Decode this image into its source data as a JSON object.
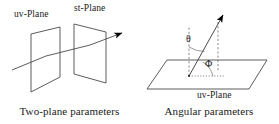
{
  "figure": {
    "background_color": "#ffffff",
    "stroke_color": "#4a4a4a",
    "arrow_color": "#000000",
    "text_color": "#1a1a1a"
  },
  "panels": {
    "two_plane": {
      "caption": "Two-plane parameters",
      "labels": {
        "uv_plane": "uv-Plane",
        "st_plane": "st-Plane"
      },
      "elements": {
        "uv_plane_shape": "parallelogram",
        "st_plane_shape": "parallelogram",
        "ray": "ray-line-through-two-planes",
        "ray_arrowhead": "arrow-right"
      }
    },
    "angular": {
      "caption": "Angular parameters",
      "labels": {
        "uv_plane": "uv-Plane",
        "theta": "θ",
        "phi": "Φ"
      },
      "elements": {
        "base_plane_shape": "parallelogram",
        "normal_axis": "dashed-vertical-axis",
        "ray": "ray-from-origin",
        "ray_arrowhead": "arrow-up-right",
        "theta_arc": "arc-between-normal-and-ray",
        "phi_arc": "arc-in-plane",
        "projection_line": "dotted-projection-in-plane",
        "drop_line": "dashed-drop-line"
      }
    }
  }
}
